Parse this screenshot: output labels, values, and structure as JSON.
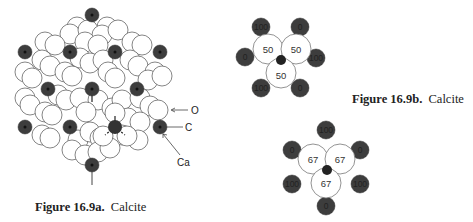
{
  "figure_a": {
    "caption_number": "Figure 16.9a.",
    "caption_title": "Calcite",
    "labels": {
      "oxygen": "O",
      "carbon": "C",
      "calcium": "Ca"
    }
  },
  "figure_b": {
    "caption_number": "Figure 16.9b.",
    "caption_title": "Calcite",
    "oxygen_values": [
      "50",
      "50",
      "50"
    ],
    "calcium_values": [
      "100",
      "0",
      "0",
      "100",
      "100",
      "0"
    ]
  },
  "figure_c": {
    "oxygen_values": [
      "67",
      "67",
      "67"
    ],
    "calcium_values": [
      "100",
      "0",
      "0",
      "100",
      "100",
      "0"
    ]
  },
  "colors": {
    "calcium": "#3a3a3a",
    "oxygen_fill": "#ffffff",
    "outline": "#555555",
    "carbon": "#111111"
  }
}
